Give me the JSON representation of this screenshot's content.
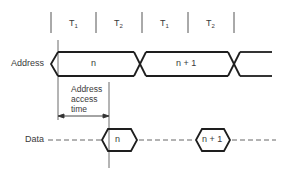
{
  "diagram": {
    "type": "timing-diagram",
    "colors": {
      "line": "#1e1e1e",
      "text": "#3a3a3a",
      "background": "#ffffff"
    },
    "clock_periods": [
      {
        "label": "T",
        "sub": "1"
      },
      {
        "label": "T",
        "sub": "2"
      },
      {
        "label": "T",
        "sub": "1"
      },
      {
        "label": "T",
        "sub": "2"
      }
    ],
    "signals": {
      "address": {
        "label": "Address",
        "values": [
          "n",
          "n + 1"
        ]
      },
      "data": {
        "label": "Data",
        "values": [
          "n",
          "n + 1"
        ]
      }
    },
    "annotation": {
      "text_line1": "Address",
      "text_line2": "access",
      "text_line3": "time"
    }
  }
}
